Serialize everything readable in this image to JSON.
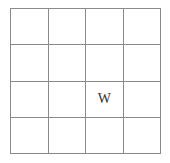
{
  "grid": {
    "rows": 4,
    "cols": 4,
    "line_color": "#8a8a8a",
    "cells": [
      [
        "",
        "",
        "",
        ""
      ],
      [
        "",
        "",
        "",
        ""
      ],
      [
        "",
        "",
        "W",
        ""
      ],
      [
        "",
        "",
        "",
        ""
      ]
    ]
  }
}
